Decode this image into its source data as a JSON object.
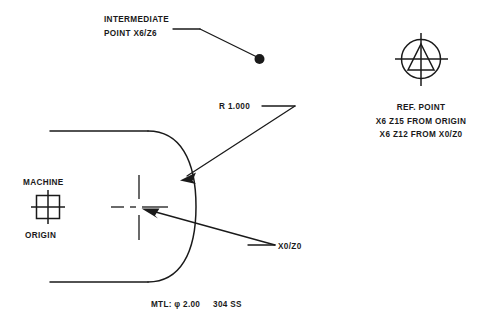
{
  "drawing": {
    "title": "CNC Lathe Part Coordinate Reference Drawing",
    "background_color": "#ffffff",
    "line_color": "#1a1a1a",
    "annotations": {
      "intermediate_point_line1": "INTERMEDIATE",
      "intermediate_point_line2": "POINT X6/Z6",
      "machine_label": "MACHINE",
      "origin_label": "ORIGIN",
      "radius_label": "R 1.000",
      "part_zero_label": "X0/Z0",
      "ref_point_label": "REF. POINT",
      "ref_point_note1": "X6 Z15 FROM ORIGIN",
      "ref_point_note2": "X6 Z12 FROM X0/Z0",
      "material_note": "MTL: φ 2.00     304 SS"
    },
    "symbols": {
      "machine_origin": "machine-origin-crosshair-square-icon",
      "reference_point": "reference-point-circle-triangle-icon",
      "intermediate_point": "intermediate-point-dot-icon",
      "part_zero": "part-zero-centerline-cross-icon"
    },
    "geometry": {
      "part_top_edge_y": 131,
      "part_bottom_edge_y": 282,
      "part_left_edge_x": 48,
      "arc_radius_label": "R 1.000",
      "part_zero_x": 139,
      "part_zero_y": 207,
      "intermediate_dot_x": 259,
      "intermediate_dot_y": 59
    }
  }
}
